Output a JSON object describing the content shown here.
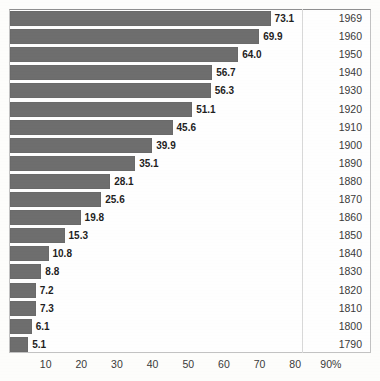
{
  "chart_data": {
    "type": "bar",
    "orientation": "horizontal",
    "title": "",
    "xlabel": "",
    "ylabel": "",
    "xlim": [
      0,
      95
    ],
    "grid": false,
    "legend": null,
    "axis_unit": "%",
    "categories": [
      "1969",
      "1960",
      "1950",
      "1940",
      "1930",
      "1920",
      "1910",
      "1900",
      "1890",
      "1880",
      "1870",
      "1860",
      "1850",
      "1840",
      "1830",
      "1820",
      "1810",
      "1800",
      "1790"
    ],
    "values": [
      73.1,
      69.9,
      64.0,
      56.7,
      56.3,
      51.1,
      45.6,
      39.9,
      35.1,
      28.1,
      25.6,
      19.8,
      15.3,
      10.8,
      8.8,
      7.2,
      7.3,
      6.1,
      5.1
    ],
    "xticks": [
      "10",
      "20",
      "30",
      "40",
      "50",
      "60",
      "70",
      "80",
      "90%"
    ],
    "xtick_values": [
      10,
      20,
      30,
      40,
      50,
      60,
      70,
      80,
      90
    ],
    "colors": {
      "bar": "#6e6e6e",
      "background": "#fdfdfb",
      "frame": "#c2c2c2",
      "text": "#2b2b2b"
    },
    "rows": [
      {
        "year": "1969",
        "value": "73.1",
        "number": 73.1
      },
      {
        "year": "1960",
        "value": "69.9",
        "number": 69.9
      },
      {
        "year": "1950",
        "value": "64.0",
        "number": 64.0
      },
      {
        "year": "1940",
        "value": "56.7",
        "number": 56.7
      },
      {
        "year": "1930",
        "value": "56.3",
        "number": 56.3
      },
      {
        "year": "1920",
        "value": "51.1",
        "number": 51.1
      },
      {
        "year": "1910",
        "value": "45.6",
        "number": 45.6
      },
      {
        "year": "1900",
        "value": "39.9",
        "number": 39.9
      },
      {
        "year": "1890",
        "value": "35.1",
        "number": 35.1
      },
      {
        "year": "1880",
        "value": "28.1",
        "number": 28.1
      },
      {
        "year": "1870",
        "value": "25.6",
        "number": 25.6
      },
      {
        "year": "1860",
        "value": "19.8",
        "number": 19.8
      },
      {
        "year": "1850",
        "value": "15.3",
        "number": 15.3
      },
      {
        "year": "1840",
        "value": "10.8",
        "number": 10.8
      },
      {
        "year": "1830",
        "value": "8.8",
        "number": 8.8
      },
      {
        "year": "1820",
        "value": "7.2",
        "number": 7.2
      },
      {
        "year": "1810",
        "value": "7.3",
        "number": 7.3
      },
      {
        "year": "1800",
        "value": "6.1",
        "number": 6.1
      },
      {
        "year": "1790",
        "value": "5.1",
        "number": 5.1
      }
    ]
  }
}
